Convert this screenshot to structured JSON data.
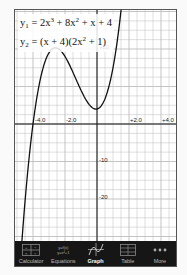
{
  "equations": {
    "y1": {
      "name": "y",
      "sub": "1",
      "rhs_parts": [
        "= 2x",
        "3",
        " + 8x",
        "2",
        " + x + 4"
      ]
    },
    "y2": {
      "name": "y",
      "sub": "2",
      "rhs_parts": [
        "= (x + 4)(2x",
        "2",
        " + 1)"
      ]
    }
  },
  "graph": {
    "x_ticks": [
      "-4.0",
      "-2.0",
      "+2.0",
      "+4.0"
    ],
    "y_ticks": [
      "+20",
      "-10",
      "-20"
    ],
    "curve_color": "#111111",
    "grid_color": "#bdbdbd"
  },
  "tabs": [
    {
      "label": "Calculator",
      "icon": "calculator-icon",
      "active": false
    },
    {
      "label": "Equations",
      "icon": "equations-icon",
      "active": false,
      "icon_text_1": "y=f(x)",
      "icon_text_2": "y=x²+1"
    },
    {
      "label": "Graph",
      "icon": "graph-icon",
      "active": true
    },
    {
      "label": "Table",
      "icon": "table-icon",
      "active": false
    },
    {
      "label": "More",
      "icon": "more-icon",
      "active": false
    }
  ]
}
